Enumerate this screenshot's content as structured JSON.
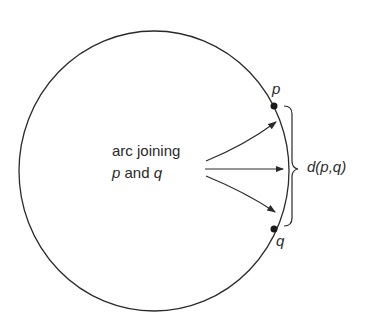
{
  "diagram": {
    "caption_line1": "arc joining",
    "caption_line2_p": "p",
    "caption_line2_and": " and ",
    "caption_line2_q": "q",
    "point_p_label": "p",
    "point_q_label": "q",
    "distance_label": "d(p,q)",
    "stroke_color": "#2a2a2a"
  }
}
